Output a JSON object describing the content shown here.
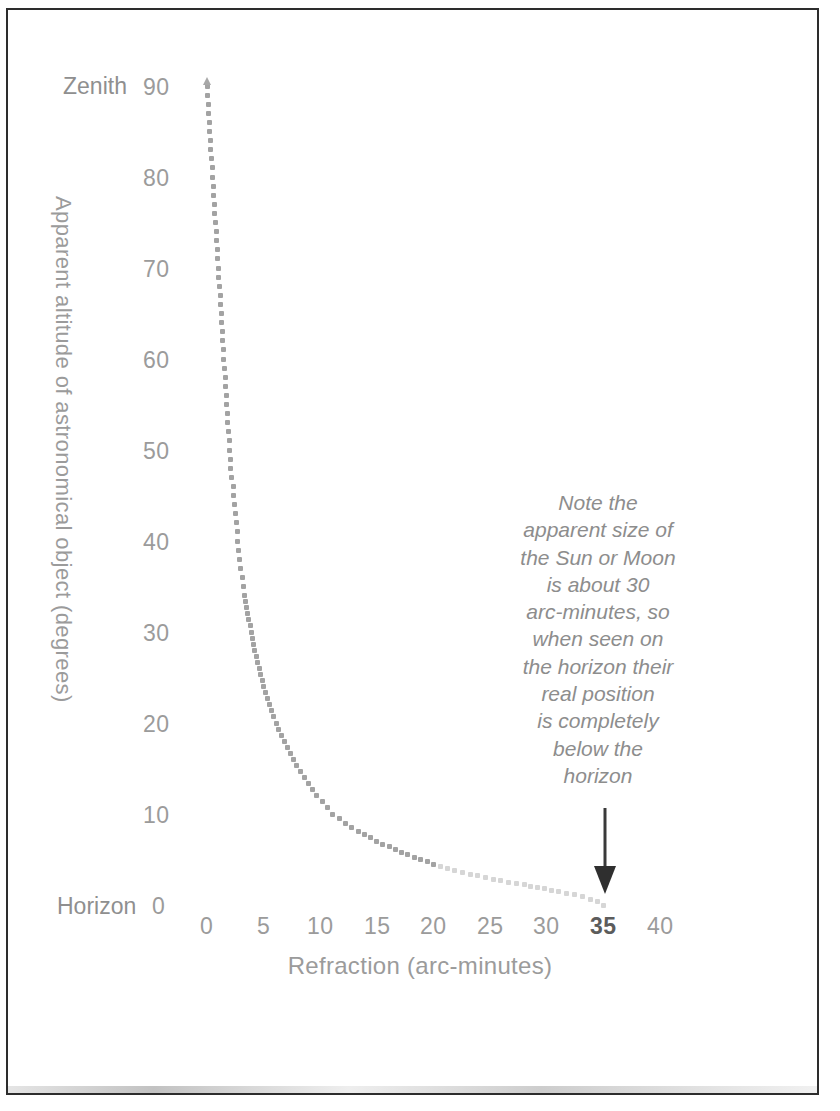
{
  "figure": {
    "frame_color": "#2d2d2d",
    "background": "#ffffff",
    "ink_color": "#9b9b9b"
  },
  "axes": {
    "y_title": "Apparent altitude of astronomical object (degrees)",
    "x_title": "Refraction (arc-minutes)",
    "y_top_label": "Zenith",
    "y_bottom_label": "Horizon",
    "y_ticks": [
      "0",
      "10",
      "20",
      "30",
      "40",
      "50",
      "60",
      "70",
      "80",
      "90"
    ],
    "x_ticks": [
      "0",
      "5",
      "10",
      "15",
      "20",
      "25",
      "30",
      "35",
      "40"
    ],
    "x_tick_emphasis": "35"
  },
  "annotation": {
    "text": "Note the apparent size of the Sun or Moon is about 30 arc-minutes, so when seen on the horizon their real position is completely below the horizon",
    "lines": [
      "Note the",
      "apparent size of",
      "the Sun or Moon",
      "is about 30",
      "arc-minutes, so",
      "when seen on",
      "the horizon their",
      "real position",
      "is completely",
      "below the",
      "horizon"
    ],
    "arrow_points_to": "35"
  },
  "chart_data": {
    "type": "scatter",
    "title": "",
    "subtitle": "",
    "xlabel": "Refraction (arc-minutes)",
    "ylabel": "Apparent altitude of astronomical object (degrees)",
    "xlim": [
      0,
      42
    ],
    "ylim": [
      0,
      92
    ],
    "xticks": [
      0,
      5,
      10,
      15,
      20,
      25,
      30,
      35,
      40
    ],
    "yticks": [
      0,
      10,
      20,
      30,
      40,
      50,
      60,
      70,
      80,
      90
    ],
    "grid": false,
    "legend": null,
    "marker": "small-square-dot",
    "series": [
      {
        "name": "Atmospheric refraction vs apparent altitude",
        "x": [
          0.0,
          0.1,
          0.2,
          0.3,
          0.4,
          0.5,
          0.6,
          0.7,
          0.8,
          0.9,
          1.0,
          1.1,
          1.2,
          1.3,
          1.4,
          1.5,
          1.6,
          1.7,
          1.8,
          1.9,
          2.0,
          2.1,
          2.3,
          2.4,
          2.6,
          2.7,
          2.9,
          3.1,
          3.3,
          3.6,
          3.9,
          4.2,
          4.6,
          5.0,
          5.5,
          6.1,
          6.8,
          7.6,
          8.6,
          9.7,
          11.1,
          12.8,
          15.0,
          17.7,
          21.2,
          24.6,
          28.0,
          31.0,
          33.2,
          34.5,
          35.0
        ],
        "y": [
          90,
          88,
          86,
          84,
          82,
          80,
          78,
          76,
          74,
          72,
          70,
          68,
          66,
          64,
          62,
          60,
          58,
          56,
          54,
          52,
          50,
          48,
          46,
          44,
          42,
          40,
          38,
          36,
          34,
          32,
          30,
          28,
          26,
          24,
          22,
          20,
          18,
          16,
          14,
          12,
          10,
          8.5,
          7,
          5.5,
          4,
          3,
          2.2,
          1.5,
          0.9,
          0.4,
          0.0
        ]
      }
    ],
    "annotations": [
      {
        "text": "Note the apparent size of the Sun or Moon is about 30 arc-minutes, so when seen on the horizon their real position is completely below the horizon",
        "arrow_to_x": 35,
        "arrow_to_y": 0
      }
    ],
    "axis_endpoint_labels": {
      "y_max": "Zenith",
      "y_min": "Horizon"
    }
  }
}
